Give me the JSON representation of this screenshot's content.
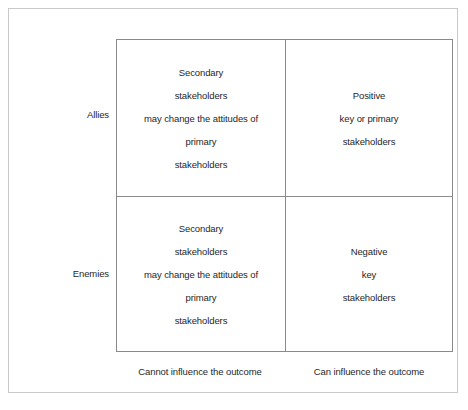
{
  "diagram": {
    "type": "2x2-matrix",
    "title": "",
    "row_axis": {
      "labels": [
        "Allies",
        "Enemies"
      ]
    },
    "column_axis": {
      "labels": [
        "Cannot influence the outcome",
        "Can influence the outcome"
      ]
    },
    "colors": {
      "outer_border": "#c9c9c9",
      "matrix_border": "#8a8a8a",
      "divider": "#8a8a8a",
      "background": "#ffffff",
      "text": "#1f1f1f"
    },
    "quadrants": {
      "top_left": {
        "row": "Allies",
        "column": "Cannot influence the outcome",
        "lines": [
          "Secondary",
          "stakeholders",
          "may change the attitudes of",
          "primary",
          "stakeholders"
        ]
      },
      "top_right": {
        "row": "Allies",
        "column": "Can influence the outcome",
        "lines": [
          "Positive",
          "key or primary",
          "stakeholders"
        ]
      },
      "bottom_left": {
        "row": "Enemies",
        "column": "Cannot influence the outcome",
        "lines": [
          "Secondary",
          "stakeholders",
          "may change the attitudes of",
          "primary",
          "stakeholders"
        ]
      },
      "bottom_right": {
        "row": "Enemies",
        "column": "Can influence the outcome",
        "lines": [
          "Negative",
          "key",
          "stakeholders"
        ]
      }
    }
  }
}
